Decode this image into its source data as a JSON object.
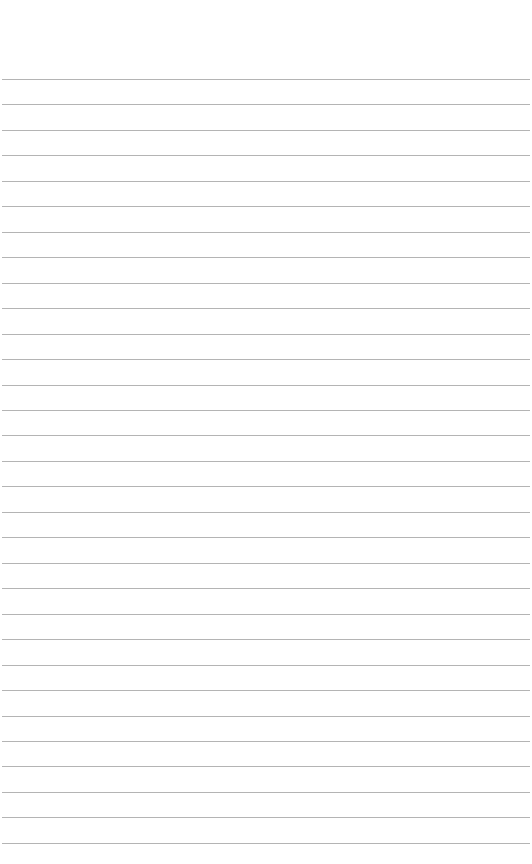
{
  "page": {
    "type": "lined-paper",
    "background_color": "#ffffff",
    "line_color": "#b4b4b4",
    "line_count": 31,
    "first_line_y": 79,
    "line_spacing": 25.46,
    "line_left": 2,
    "line_width": 528
  }
}
